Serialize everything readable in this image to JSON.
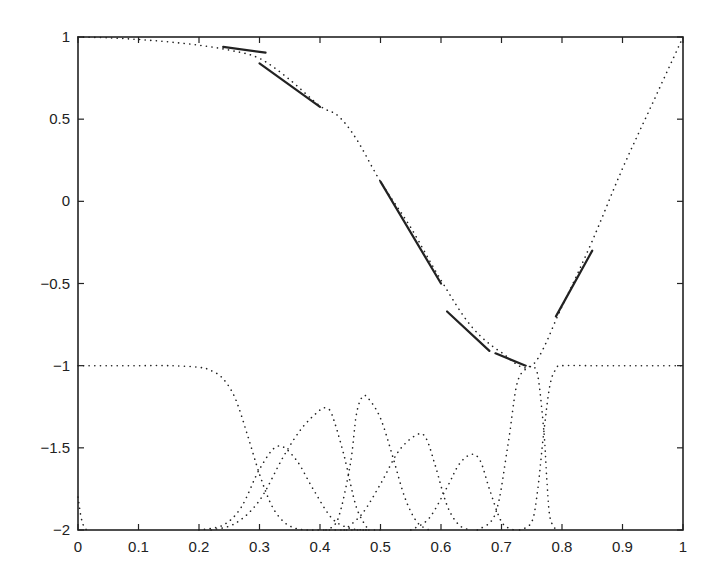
{
  "chart_data": {
    "type": "line",
    "title": "",
    "xlabel": "",
    "ylabel": "",
    "xlim": [
      0,
      1
    ],
    "ylim": [
      -2,
      1
    ],
    "grid": false,
    "legend": null,
    "x_ticks": [
      {
        "value": 0,
        "label": "0"
      },
      {
        "value": 0.1,
        "label": "0.1"
      },
      {
        "value": 0.2,
        "label": "0.2"
      },
      {
        "value": 0.3,
        "label": "0.3"
      },
      {
        "value": 0.4,
        "label": "0.4"
      },
      {
        "value": 0.5,
        "label": "0.5"
      },
      {
        "value": 0.6,
        "label": "0.6"
      },
      {
        "value": 0.7,
        "label": "0.7"
      },
      {
        "value": 0.8,
        "label": "0.8"
      },
      {
        "value": 0.9,
        "label": "0.9"
      },
      {
        "value": 1,
        "label": "1"
      }
    ],
    "y_ticks": [
      {
        "value": 1,
        "label": "1"
      },
      {
        "value": 0.5,
        "label": "0.5"
      },
      {
        "value": 0,
        "label": "0"
      },
      {
        "value": -0.5,
        "label": "-0.5"
      },
      {
        "value": -1,
        "label": "-1"
      },
      {
        "value": -1.5,
        "label": "-1.5"
      },
      {
        "value": -2,
        "label": "-2"
      }
    ],
    "series": [
      {
        "name": "target function",
        "style": "dotted",
        "x": [
          0,
          0.05,
          0.1,
          0.15,
          0.2,
          0.25,
          0.3,
          0.35,
          0.4,
          0.43,
          0.46,
          0.5,
          0.55,
          0.6,
          0.65,
          0.7,
          0.75,
          0.8,
          0.85,
          0.9,
          0.95,
          1
        ],
        "y": [
          1,
          0.995,
          0.985,
          0.97,
          0.95,
          0.92,
          0.87,
          0.74,
          0.58,
          0.52,
          0.38,
          0.12,
          -0.16,
          -0.48,
          -0.76,
          -0.92,
          -1.0,
          -0.64,
          -0.24,
          0.2,
          0.6,
          1.0
        ]
      },
      {
        "name": "piecewise linear approximation",
        "style": "solid",
        "segments": [
          [
            [
              0.24,
              0.94
            ],
            [
              0.31,
              0.905
            ]
          ],
          [
            [
              0.3,
              0.84
            ],
            [
              0.4,
              0.575
            ]
          ],
          [
            [
              0.5,
              0.12
            ],
            [
              0.6,
              -0.5
            ]
          ],
          [
            [
              0.61,
              -0.67
            ],
            [
              0.68,
              -0.91
            ]
          ],
          [
            [
              0.69,
              -0.925
            ],
            [
              0.74,
              -1.0
            ]
          ],
          [
            [
              0.79,
              -0.7
            ],
            [
              0.85,
              -0.3
            ]
          ]
        ]
      },
      {
        "name": "basis 0 (left edge)",
        "style": "dotted",
        "x": [
          0,
          0.005,
          0.01,
          0.015,
          0.02
        ],
        "y": [
          -1.8,
          -1.92,
          -1.98,
          -2.0,
          -2.0
        ]
      },
      {
        "name": "basis 1 (left plateau)",
        "style": "dotted",
        "x": [
          0,
          0.05,
          0.1,
          0.15,
          0.2,
          0.22,
          0.24,
          0.26,
          0.28,
          0.3,
          0.32,
          0.34,
          0.36,
          0.38,
          0.4,
          0.45,
          0.5
        ],
        "y": [
          -1.0,
          -1.0,
          -1.0,
          -1.0,
          -1.01,
          -1.03,
          -1.08,
          -1.2,
          -1.42,
          -1.66,
          -1.85,
          -1.95,
          -1.99,
          -2.0,
          -2.0,
          -2.0,
          -2.0
        ]
      },
      {
        "name": "basis 2",
        "style": "dotted",
        "x": [
          0.2,
          0.24,
          0.27,
          0.3,
          0.33,
          0.36,
          0.39,
          0.42,
          0.45,
          0.48
        ],
        "y": [
          -2.0,
          -1.97,
          -1.86,
          -1.63,
          -1.49,
          -1.57,
          -1.76,
          -1.93,
          -1.99,
          -2.0
        ]
      },
      {
        "name": "basis 3",
        "style": "dotted",
        "x": [
          0.22,
          0.26,
          0.3,
          0.34,
          0.37,
          0.4,
          0.41,
          0.42,
          0.44,
          0.46,
          0.48
        ],
        "y": [
          -2.0,
          -1.96,
          -1.82,
          -1.55,
          -1.38,
          -1.27,
          -1.26,
          -1.3,
          -1.55,
          -1.86,
          -2.0
        ]
      },
      {
        "name": "basis 4",
        "style": "dotted",
        "x": [
          0.41,
          0.43,
          0.45,
          0.46,
          0.47,
          0.48,
          0.5,
          0.52,
          0.54,
          0.56,
          0.58
        ],
        "y": [
          -2.0,
          -1.93,
          -1.6,
          -1.3,
          -1.19,
          -1.2,
          -1.32,
          -1.55,
          -1.8,
          -1.95,
          -2.0
        ]
      },
      {
        "name": "basis 5",
        "style": "dotted",
        "x": [
          0.44,
          0.47,
          0.5,
          0.53,
          0.56,
          0.575,
          0.59,
          0.61,
          0.63,
          0.65
        ],
        "y": [
          -2.0,
          -1.9,
          -1.72,
          -1.52,
          -1.42,
          -1.44,
          -1.6,
          -1.85,
          -1.97,
          -2.0
        ]
      },
      {
        "name": "basis 6",
        "style": "dotted",
        "x": [
          0.55,
          0.58,
          0.61,
          0.63,
          0.65,
          0.665,
          0.68,
          0.7,
          0.72
        ],
        "y": [
          -2.0,
          -1.93,
          -1.74,
          -1.6,
          -1.54,
          -1.58,
          -1.75,
          -1.95,
          -2.0
        ]
      },
      {
        "name": "basis 7",
        "style": "dotted",
        "x": [
          0.66,
          0.69,
          0.71,
          0.725,
          0.74,
          0.75,
          0.76,
          0.77,
          0.775,
          0.78,
          0.79
        ],
        "y": [
          -2.0,
          -1.9,
          -1.5,
          -1.12,
          -1.02,
          -1.01,
          -1.06,
          -1.4,
          -1.7,
          -1.92,
          -2.0
        ]
      },
      {
        "name": "basis 8 (right plateau)",
        "style": "dotted",
        "x": [
          0.73,
          0.75,
          0.76,
          0.77,
          0.78,
          0.79,
          0.8,
          0.85,
          0.9,
          0.95,
          1
        ],
        "y": [
          -2.0,
          -1.95,
          -1.75,
          -1.4,
          -1.12,
          -1.02,
          -1.0,
          -1.0,
          -1.0,
          -1.0,
          -1.0
        ]
      }
    ]
  },
  "colors": {
    "axes": "#222222",
    "line": "#222222",
    "background": "#ffffff"
  }
}
